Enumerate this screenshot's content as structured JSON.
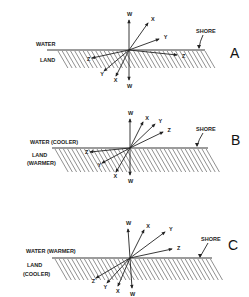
{
  "diagram": {
    "panels": [
      {
        "id": "A",
        "label": "A",
        "water_label": "WATER",
        "land_label_line1": "LAND",
        "land_label_line2": "",
        "shore_label": "SHORE",
        "origin": [
          129,
          50
        ],
        "shore_y": 50,
        "incident": [
          {
            "name": "W",
            "x": 129,
            "y": 20
          },
          {
            "name": "X",
            "x": 148,
            "y": 23
          },
          {
            "name": "Y",
            "x": 159,
            "y": 39
          },
          {
            "name": "Z",
            "x": 177,
            "y": 55
          }
        ],
        "refracted": [
          {
            "name": "Z",
            "x": 92,
            "y": 58
          },
          {
            "name": "Y",
            "x": 104,
            "y": 71
          },
          {
            "name": "X",
            "x": 116,
            "y": 76
          },
          {
            "name": "W",
            "x": 129,
            "y": 80
          }
        ]
      },
      {
        "id": "B",
        "label": "B",
        "water_label": "WATER  (COOLER)",
        "land_label_line1": "LAND",
        "land_label_line2": "(WARMER)",
        "shore_label": "SHORE",
        "origin": [
          130,
          148
        ],
        "shore_y": 148,
        "incident": [
          {
            "name": "W",
            "x": 130,
            "y": 119
          },
          {
            "name": "X",
            "x": 143,
            "y": 122
          },
          {
            "name": "Y",
            "x": 155,
            "y": 124
          },
          {
            "name": "Z",
            "x": 163,
            "y": 132
          }
        ],
        "refracted": [
          {
            "name": "Z",
            "x": 90,
            "y": 152
          },
          {
            "name": "Y",
            "x": 102,
            "y": 163
          },
          {
            "name": "X",
            "x": 116,
            "y": 172
          },
          {
            "name": "W",
            "x": 130,
            "y": 175
          }
        ]
      },
      {
        "id": "C",
        "label": "C",
        "water_label": "WATER  (WARMER)",
        "land_label_line1": "LAND",
        "land_label_line2": "(COOLER)",
        "shore_label": "SHORE",
        "origin": [
          130,
          258
        ],
        "shore_y": 258,
        "incident": [
          {
            "name": "W",
            "x": 128,
            "y": 229
          },
          {
            "name": "X",
            "x": 144,
            "y": 230
          },
          {
            "name": "Y",
            "x": 165,
            "y": 232
          },
          {
            "name": "Z",
            "x": 172,
            "y": 249
          }
        ],
        "refracted": [
          {
            "name": "Z",
            "x": 96,
            "y": 278
          },
          {
            "name": "Y",
            "x": 107,
            "y": 283
          },
          {
            "name": "X",
            "x": 118,
            "y": 286
          },
          {
            "name": "W",
            "x": 132,
            "y": 288
          }
        ]
      }
    ]
  }
}
